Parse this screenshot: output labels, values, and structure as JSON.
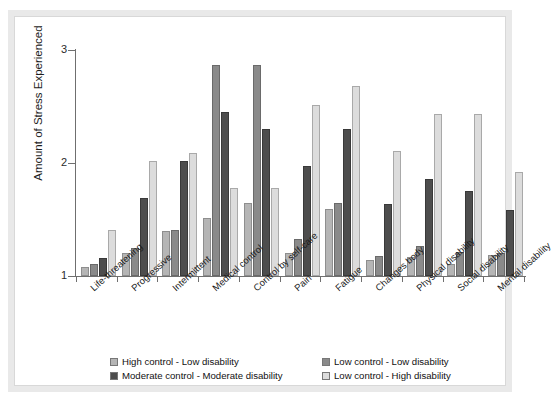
{
  "chart_data": {
    "type": "bar",
    "title": "",
    "xlabel": "",
    "ylabel": "Amount of Stress Experienced",
    "ylim": [
      1,
      3
    ],
    "yticks": [
      1,
      2,
      3
    ],
    "ytick_labels": [
      "1",
      "2",
      "3"
    ],
    "grid": false,
    "legend_position": "bottom",
    "categories": [
      "Life-threatening",
      "Progressive",
      "Intermittent",
      "Medical control",
      "Control by self-care",
      "Pain",
      "Fatigue",
      "Changes body",
      "Physical disability",
      "Social disability",
      "Mental disability"
    ],
    "series": [
      {
        "name": "High control - Low disability",
        "color": "#b5b5b5",
        "values": [
          1.08,
          1.2,
          1.4,
          1.51,
          1.65,
          1.2,
          1.59,
          1.14,
          1.17,
          1.11,
          1.19
        ]
      },
      {
        "name": "Low control - Low disability",
        "color": "#8a8a8a",
        "values": [
          1.11,
          1.25,
          1.41,
          2.87,
          2.87,
          1.33,
          1.65,
          1.18,
          1.27,
          1.21,
          1.2
        ]
      },
      {
        "name": "Moderate control - Moderate disability",
        "color": "#4d4d4d",
        "values": [
          1.16,
          1.69,
          2.02,
          2.45,
          2.3,
          1.97,
          2.3,
          1.64,
          1.86,
          1.75,
          1.58
        ]
      },
      {
        "name": "Low control - High disability",
        "color": "#dcdcdc",
        "values": [
          1.41,
          2.02,
          2.09,
          1.78,
          1.78,
          2.51,
          2.68,
          2.11,
          2.43,
          2.43,
          1.92
        ]
      }
    ]
  },
  "legend": {
    "items": [
      {
        "label": "High control - Low disability",
        "color": "#b5b5b5"
      },
      {
        "label": "Low control - Low disability",
        "color": "#8a8a8a"
      },
      {
        "label": "Moderate control - Moderate disability",
        "color": "#4d4d4d"
      },
      {
        "label": "Low control - High disability",
        "color": "#dcdcdc"
      }
    ]
  },
  "axes": {
    "y_title": "Amount of Stress Experienced",
    "y_tick_1": "1",
    "y_tick_2": "2",
    "y_tick_3": "3"
  }
}
